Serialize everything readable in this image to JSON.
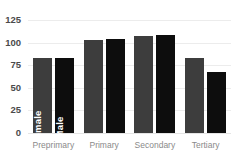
{
  "chart_data": {
    "type": "bar",
    "title": "",
    "subtitle": "",
    "xlabel": "",
    "ylabel": "",
    "categories": [
      "Preprimary",
      "Primary",
      "Secondary",
      "Tertiary"
    ],
    "series": [
      {
        "name": "Female",
        "color": "#3d3d3d",
        "values": [
          83,
          103,
          107,
          83
        ]
      },
      {
        "name": "Male",
        "color": "#0d0d0d",
        "values": [
          83,
          104,
          108,
          67
        ]
      }
    ],
    "ylim": [
      0,
      125
    ],
    "yticks": [
      125,
      100,
      75,
      50,
      25,
      0
    ],
    "ytick_labels": [
      "125",
      "100",
      "75",
      "50",
      "25",
      "0"
    ],
    "grid": true,
    "legend": "in-bar-labels",
    "inline_bar_labels": {
      "group": "Preprimary",
      "female": "Female",
      "male": "Male"
    },
    "colors": {
      "female": "#3d3d3d",
      "male": "#0d0d0d",
      "grid": "#ececec",
      "tick_text": "#4a4a4a",
      "category_text": "#8a8a8a",
      "background": "#ffffff"
    }
  }
}
